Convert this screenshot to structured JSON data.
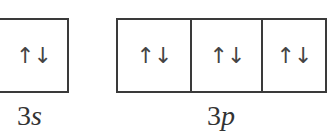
{
  "diagram": {
    "subshells": [
      {
        "number": "3",
        "letter": "s",
        "orbitals": [
          {
            "spins": "↑↓"
          }
        ]
      },
      {
        "number": "3",
        "letter": "p",
        "orbitals": [
          {
            "spins": "↑↓"
          },
          {
            "spins": "↑↓"
          },
          {
            "spins": "↑↓"
          }
        ]
      }
    ],
    "colors": {
      "line": "#3a3a3a",
      "text": "#333333",
      "background": "#ffffff"
    }
  }
}
